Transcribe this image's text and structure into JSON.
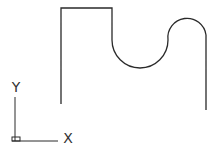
{
  "drawing": {
    "stroke_color": "#2a2a2a",
    "profile_path": "M 61 104 L 61 8 L 112 8 L 112 40 A 28 28 0 0 0 168 40 A 16 16 0 0 1 206 35 L 206 110"
  },
  "ucs_icon": {
    "x_label": "X",
    "y_label": "Y"
  }
}
